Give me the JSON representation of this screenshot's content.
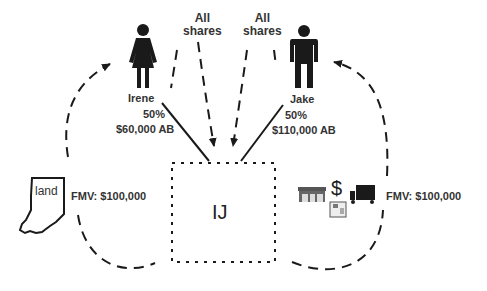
{
  "diagram": {
    "entity": {
      "label": "IJ"
    },
    "shareholders": [
      {
        "name": "Irene",
        "ownership": "50%",
        "basis": "$60,000 AB"
      },
      {
        "name": "Jake",
        "ownership": "50%",
        "basis": "$110,000 AB"
      }
    ],
    "share_transfers": [
      {
        "label_line1": "All",
        "label_line2": "shares"
      },
      {
        "label_line1": "All",
        "label_line2": "shares"
      }
    ],
    "assets": [
      {
        "type": "land",
        "label": "land",
        "fmv": "FMV: $100,000"
      },
      {
        "type": "business-assets",
        "icons": [
          "store-icon",
          "dollar-icon",
          "truck-icon",
          "register-icon"
        ],
        "fmv": "FMV: $100,000"
      }
    ],
    "colors": {
      "ink": "#1a1a1a",
      "text": "#333333",
      "background": "#ffffff"
    }
  }
}
